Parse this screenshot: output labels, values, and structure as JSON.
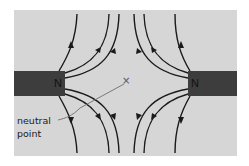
{
  "diagram": {
    "magnets": [
      {
        "side": "left",
        "pole_label": "N"
      },
      {
        "side": "right",
        "pole_label": "N"
      }
    ],
    "neutral_point": {
      "marker": "×",
      "label_line1": "neutral",
      "label_line2": "point"
    },
    "colors": {
      "background_panel": "#d6d6d6",
      "magnet": "#3d3d3d",
      "field_line": "#1a1a1a",
      "leader_line": "#6e6e6e"
    }
  }
}
